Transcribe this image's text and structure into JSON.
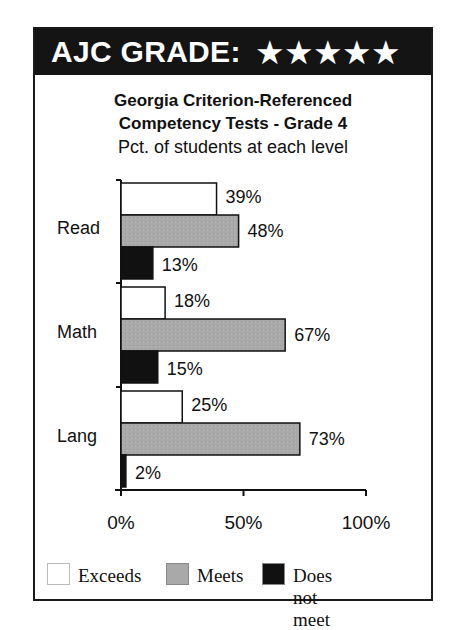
{
  "header": {
    "title": "AJC GRADE:",
    "stars": "★★★★★",
    "star_count": 5
  },
  "titles": {
    "line1": "Georgia Criterion-Referenced",
    "line2": "Competency Tests - Grade 4",
    "subtitle": "Pct. of students at each level"
  },
  "colors": {
    "exceeds": "#ffffff",
    "meets": "#a9a9a9",
    "does_not_meet": "#111111",
    "header_bg": "#141414"
  },
  "chart_data": {
    "type": "bar",
    "orientation": "horizontal",
    "title": "Georgia Criterion-Referenced Competency Tests - Grade 4",
    "subtitle": "Pct. of students at each level",
    "categories": [
      "Read",
      "Math",
      "Lang"
    ],
    "series": [
      {
        "name": "Exceeds",
        "values": [
          39,
          18,
          25
        ],
        "labels": [
          "39%",
          "18%",
          "25%"
        ]
      },
      {
        "name": "Meets",
        "values": [
          48,
          67,
          73
        ],
        "labels": [
          "48%",
          "67%",
          "73%"
        ]
      },
      {
        "name": "Does not meet",
        "values": [
          13,
          15,
          2
        ],
        "labels": [
          "13%",
          "15%",
          "2%"
        ]
      }
    ],
    "xlabel": "",
    "ylabel": "",
    "xlim": [
      0,
      100
    ],
    "x_ticks": [
      "0%",
      "50%",
      "100%"
    ],
    "grid": false,
    "legend_position": "bottom"
  },
  "legend": [
    {
      "label": "Exceeds"
    },
    {
      "label": "Meets"
    },
    {
      "label": "Does not meet"
    }
  ]
}
